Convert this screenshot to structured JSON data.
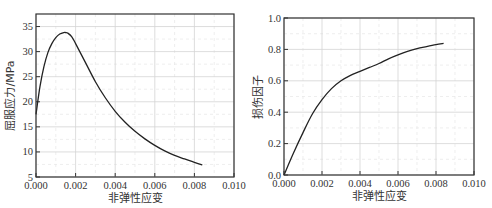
{
  "chart_data": [
    {
      "type": "line",
      "title": "",
      "xlabel": "非弹性应变",
      "ylabel": "屈服应力/MPa",
      "xlim": [
        0.0,
        0.01
      ],
      "ylim": [
        5,
        37.5
      ],
      "xticks": [
        "0.000",
        "0.002",
        "0.004",
        "0.006",
        "0.008",
        "0.010"
      ],
      "yticks": [
        "5",
        "10",
        "15",
        "20",
        "25",
        "30",
        "35"
      ],
      "grid": true,
      "legend": null,
      "series": [
        {
          "name": "屈服应力",
          "x": [
            0.0,
            0.0002,
            0.0004,
            0.0006,
            0.0008,
            0.001,
            0.0012,
            0.0014,
            0.0015,
            0.0016,
            0.0018,
            0.002,
            0.0025,
            0.003,
            0.0035,
            0.004,
            0.0045,
            0.005,
            0.0055,
            0.006,
            0.0065,
            0.007,
            0.0075,
            0.008,
            0.0084
          ],
          "y": [
            17.5,
            23.0,
            27.0,
            29.8,
            31.6,
            32.8,
            33.5,
            33.8,
            33.8,
            33.7,
            33.0,
            31.6,
            27.8,
            24.0,
            20.8,
            18.1,
            15.9,
            14.1,
            12.6,
            11.3,
            10.2,
            9.3,
            8.6,
            7.9,
            7.4
          ]
        }
      ]
    },
    {
      "type": "line",
      "title": "",
      "xlabel": "非弹性应变",
      "ylabel": "损伤因子",
      "xlim": [
        0.0,
        0.01
      ],
      "ylim": [
        0.0,
        1.0
      ],
      "xticks": [
        "0.000",
        "0.002",
        "0.004",
        "0.006",
        "0.008",
        "0.010"
      ],
      "yticks": [
        "0.0",
        "0.2",
        "0.4",
        "0.6",
        "0.8",
        "1.0"
      ],
      "grid": true,
      "legend": null,
      "series": [
        {
          "name": "损伤因子",
          "x": [
            0.0,
            0.0005,
            0.001,
            0.0015,
            0.002,
            0.0025,
            0.003,
            0.0035,
            0.004,
            0.0045,
            0.005,
            0.0055,
            0.006,
            0.0065,
            0.007,
            0.0075,
            0.008,
            0.0084
          ],
          "y": [
            0.0,
            0.14,
            0.27,
            0.39,
            0.48,
            0.55,
            0.6,
            0.635,
            0.66,
            0.685,
            0.71,
            0.74,
            0.765,
            0.787,
            0.805,
            0.818,
            0.83,
            0.838
          ]
        }
      ]
    }
  ],
  "plots": [
    {
      "id": "yield-stress",
      "frame": {
        "x0": 36,
        "y0": 14,
        "x1": 234,
        "y1": 177
      },
      "xlabel": "非弹性应变",
      "ylabel": "屈服应力/MPa"
    },
    {
      "id": "damage-factor",
      "frame": {
        "x0": 284,
        "y0": 18,
        "x1": 474,
        "y1": 175
      },
      "xlabel": "非弹性应变",
      "ylabel": "损伤因子"
    }
  ],
  "colors": {
    "curve": "#222222",
    "frame": "#333333",
    "grid": "#d4d4d4"
  }
}
